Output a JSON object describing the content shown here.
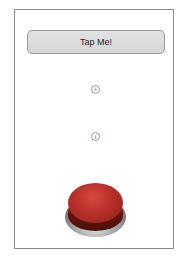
{
  "screen": {
    "tap_button": {
      "label": "Tap Me!"
    },
    "add_icon": {
      "glyph": "+",
      "icon": "plus-circle-icon"
    },
    "info_icon": {
      "glyph": "i",
      "icon": "info-circle-icon"
    },
    "big_button": {
      "icon": "red-push-button",
      "color": "#b8302a"
    }
  }
}
